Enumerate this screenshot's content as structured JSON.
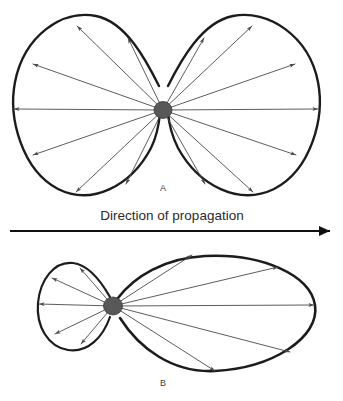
{
  "figure": {
    "title_caption": "Direction of propagation",
    "background_color": "#ffffff",
    "outline_color": "#1c1c1c",
    "ray_color": "#4a4a4a",
    "source_color": "#585858",
    "axis_color": "#111111",
    "panels": [
      {
        "id": "A",
        "label": "A",
        "label_x": 163,
        "label_y": 191,
        "description": "symmetric bidirectional radiation pattern with two equal lobes",
        "source": {
          "cx": 163,
          "cy": 110,
          "rx": 9,
          "ry": 8.5
        },
        "lobes": [
          {
            "name": "left-lobe",
            "side": "left",
            "stroke_width": 2.4,
            "path": "M 159 86 C 146 60 126 22 96 16 C 62 9 24 36 15 82 C 8 118 22 170 58 189 C 92 206 131 186 151 148 C 157 136 159 124 160 113"
          },
          {
            "name": "right-lobe",
            "side": "right",
            "stroke_width": 2.4,
            "path": "M 168 86 C 181 60 202 22 233 16 C 268 9 309 36 318 82 C 325 118 311 170 274 189 C 239 206 199 186 178 148 C 172 136 169 124 168 113"
          }
        ],
        "rays": [
          {
            "name": "ray-left-up-steep",
            "x2": 77,
            "y2": 26
          },
          {
            "name": "ray-left-up-mid",
            "x2": 33,
            "y2": 64
          },
          {
            "name": "ray-left-horizontal",
            "x2": 14,
            "y2": 109
          },
          {
            "name": "ray-left-down-mid",
            "x2": 33,
            "y2": 155
          },
          {
            "name": "ray-left-down-steep",
            "x2": 76,
            "y2": 192
          },
          {
            "name": "ray-left-inner-up",
            "x2": 128,
            "y2": 38
          },
          {
            "name": "ray-left-inner-down",
            "x2": 126,
            "y2": 184
          },
          {
            "name": "ray-right-up-steep",
            "x2": 252,
            "y2": 26
          },
          {
            "name": "ray-right-up-mid",
            "x2": 295,
            "y2": 64
          },
          {
            "name": "ray-right-horizontal",
            "x2": 318,
            "y2": 109
          },
          {
            "name": "ray-right-down-mid",
            "x2": 296,
            "y2": 155
          },
          {
            "name": "ray-right-down-steep",
            "x2": 253,
            "y2": 192
          },
          {
            "name": "ray-right-inner-up",
            "x2": 204,
            "y2": 38
          },
          {
            "name": "ray-right-inner-down",
            "x2": 205,
            "y2": 184
          }
        ]
      },
      {
        "id": "B",
        "label": "B",
        "label_x": 163,
        "label_y": 386,
        "description": "asymmetric directional radiation pattern with a small back lobe and a large forward lobe",
        "source": {
          "cx": 113,
          "cy": 306,
          "rx": 9.5,
          "ry": 9
        },
        "lobes": [
          {
            "name": "back-lobe-small",
            "side": "left",
            "stroke_width": 2.2,
            "path": "M 110 297 C 102 283 90 265 73 263 C 54 261 40 280 38 303 C 36 326 48 347 68 350 C 88 353 103 337 110 317"
          },
          {
            "name": "forward-lobe-large",
            "side": "right",
            "stroke_width": 2.6,
            "path": "M 118 298 C 134 277 164 258 205 256 C 262 253 310 275 315 305 C 320 338 272 368 215 371 C 172 373 139 348 120 318"
          }
        ],
        "rays": [
          {
            "name": "ray-back-up-steep",
            "x2": 80,
            "y2": 268
          },
          {
            "name": "ray-back-up-mid",
            "x2": 52,
            "y2": 278
          },
          {
            "name": "ray-back-horizontal",
            "x2": 39,
            "y2": 304
          },
          {
            "name": "ray-back-down-mid",
            "x2": 55,
            "y2": 334
          },
          {
            "name": "ray-back-down-steep",
            "x2": 81,
            "y2": 344
          },
          {
            "name": "ray-fwd-up-steep",
            "x2": 192,
            "y2": 255
          },
          {
            "name": "ray-fwd-up-mid",
            "x2": 278,
            "y2": 267
          },
          {
            "name": "ray-fwd-horizontal",
            "x2": 314,
            "y2": 305
          },
          {
            "name": "ray-fwd-down-mid",
            "x2": 290,
            "y2": 352
          },
          {
            "name": "ray-fwd-down-steep",
            "x2": 215,
            "y2": 371
          }
        ]
      }
    ],
    "propagation_axis": {
      "label": "Direction of propagation",
      "label_x": 172,
      "label_y": 220,
      "line_x1": 10,
      "line_x2": 330,
      "line_y": 231,
      "arrowhead": "right"
    }
  }
}
